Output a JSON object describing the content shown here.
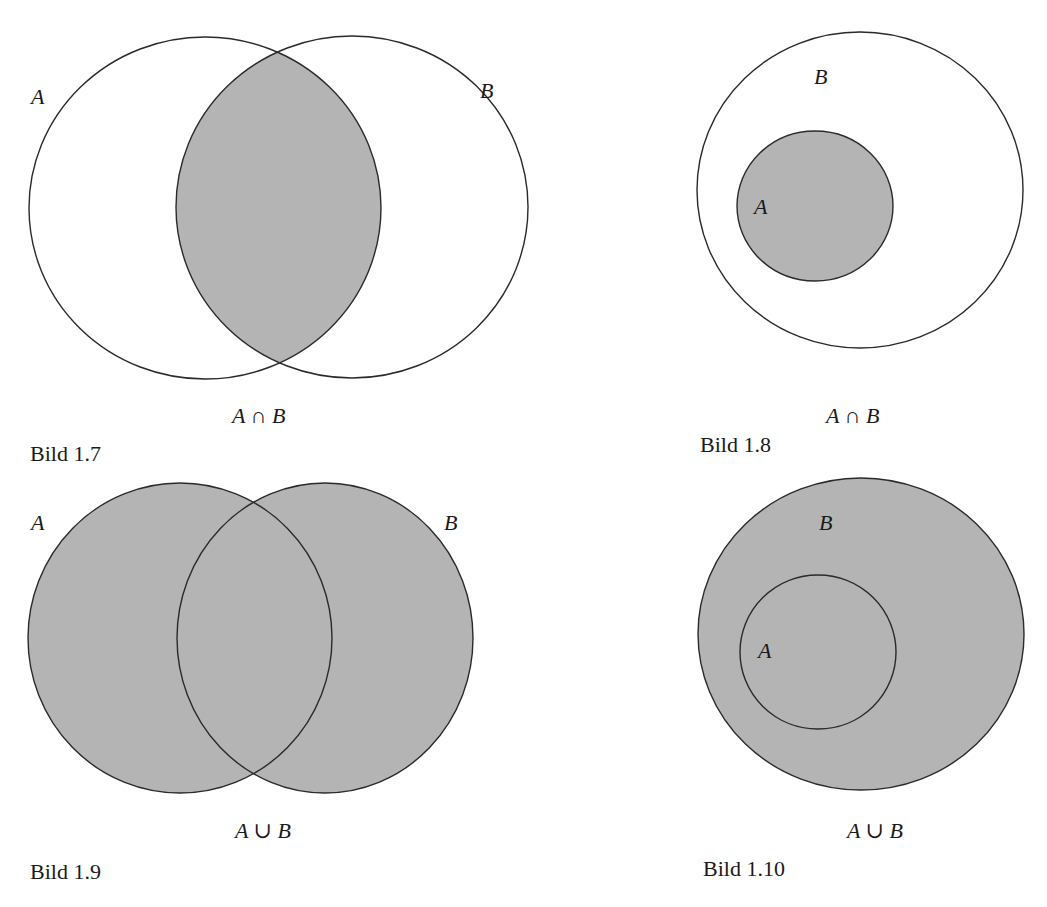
{
  "colors": {
    "fill": "#b4b4b4",
    "stroke": "#2a2a2a",
    "background": "#ffffff"
  },
  "figures": [
    {
      "id": "bild-1-7",
      "number": "Bild 1.7",
      "caption": "A ∩ B",
      "operation": "intersection",
      "labels": {
        "a": "A",
        "b": "B"
      },
      "circles": {
        "a": {
          "cx": 205,
          "cy": 208,
          "rx": 176,
          "ry": 171
        },
        "b": {
          "cx": 352,
          "cy": 207,
          "rx": 176,
          "ry": 171
        }
      },
      "shaded_region": "A∩B"
    },
    {
      "id": "bild-1-8",
      "number": "Bild 1.8",
      "caption": "A ∩ B",
      "operation": "intersection (A ⊂ B)",
      "labels": {
        "a": "A",
        "b": "B"
      },
      "circles": {
        "b": {
          "cx": 860,
          "cy": 190,
          "rx": 163,
          "ry": 158
        },
        "a": {
          "cx": 815,
          "cy": 206,
          "rx": 78,
          "ry": 75
        }
      },
      "shaded_region": "A"
    },
    {
      "id": "bild-1-9",
      "number": "Bild 1.9",
      "caption": "A ∪ B",
      "operation": "union",
      "labels": {
        "a": "A",
        "b": "B"
      },
      "circles": {
        "a": {
          "cx": 180,
          "cy": 638,
          "rx": 152,
          "ry": 155
        },
        "b": {
          "cx": 325,
          "cy": 638,
          "rx": 148,
          "ry": 155
        }
      },
      "shaded_region": "A∪B"
    },
    {
      "id": "bild-1-10",
      "number": "Bild 1.10",
      "caption": "A ∪ B",
      "operation": "union (A ⊂ B)",
      "labels": {
        "a": "A",
        "b": "B"
      },
      "circles": {
        "b": {
          "cx": 861,
          "cy": 634,
          "rx": 163,
          "ry": 156
        },
        "a": {
          "cx": 818,
          "cy": 652,
          "rx": 78,
          "ry": 77
        }
      },
      "shaded_region": "B"
    }
  ]
}
